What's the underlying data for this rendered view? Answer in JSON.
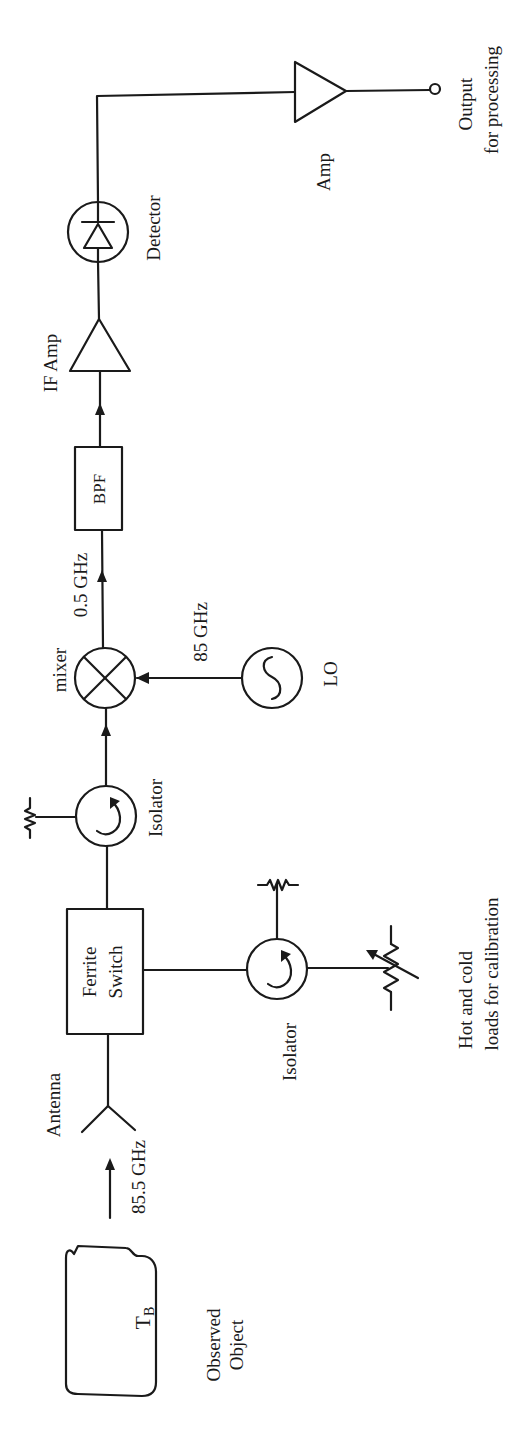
{
  "diagram": {
    "orientation": "rotated 90 degrees counter-clockwise",
    "colors": {
      "ink": "#1a1a1a",
      "background": "#ffffff"
    },
    "labels": {
      "observed_object_symbol": "T",
      "observed_object_subscript": "B",
      "observed_object_line1": "Observed",
      "observed_object_line2": "Object",
      "input_frequency": "85.5 GHz",
      "antenna": "Antenna",
      "ferrite_switch_line1": "Ferrite",
      "ferrite_switch_line2": "Switch",
      "isolator_upper": "Isolator",
      "isolator_lower": "Isolator",
      "calibration_line1": "Hot and cold",
      "calibration_line2": "loads for calibration",
      "mixer": "mixer",
      "lo_frequency": "85 GHz",
      "lo": "LO",
      "if_frequency": "0.5 GHz",
      "bpf": "BPF",
      "if_amp": "IF Amp",
      "detector": "Detector",
      "amp": "Amp",
      "output_line1": "Output",
      "output_line2": "for processing"
    },
    "components": [
      "observed-object",
      "antenna",
      "ferrite-switch",
      "isolator-signal",
      "isolator-calibration",
      "variable-load",
      "termination-resistor-1",
      "termination-resistor-2",
      "mixer",
      "local-oscillator",
      "band-pass-filter",
      "if-amplifier",
      "detector-diode",
      "output-amplifier",
      "output-terminal"
    ]
  }
}
